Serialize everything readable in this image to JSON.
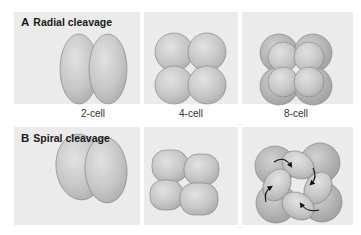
{
  "figure": {
    "rows": [
      {
        "letter": "A",
        "title": "Radial cleavage",
        "stages": [
          "2-cell",
          "4-cell",
          "8-cell"
        ]
      },
      {
        "letter": "B",
        "title": "Spiral cleavage",
        "stages": [
          "2-cell",
          "4-cell",
          "8-cell"
        ]
      }
    ],
    "captions": [
      "2-cell",
      "4-cell",
      "8-cell"
    ],
    "colors": {
      "panel_bg": "#ebebeb",
      "cell_fill": "#c4c4c4",
      "cell_stroke": "#8a8a8a",
      "arrow": "#111111"
    }
  }
}
